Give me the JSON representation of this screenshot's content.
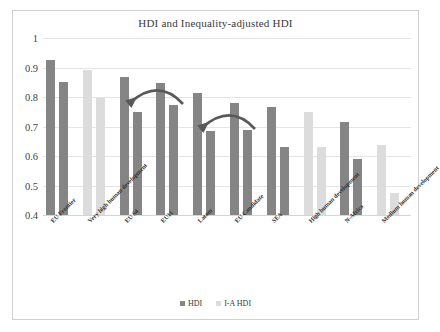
{
  "chart_data": {
    "type": "bar",
    "title": "HDI and Inequality-adjusted HDI",
    "xlabel": "",
    "ylabel": "",
    "ylim": [
      0.4,
      1
    ],
    "yticks": [
      "1",
      "0.9",
      "0.8",
      "0.7",
      "0.6",
      "0.5",
      "0.4"
    ],
    "grid": true,
    "legend_position": "bottom",
    "categories": [
      "EU Frontier",
      "Very high human development",
      "EU S4",
      "EU11",
      "Latam",
      "EU Candidate",
      "SEA",
      "High human development",
      "N-Africa",
      "Medium human development"
    ],
    "series": [
      {
        "name": "HDI",
        "values": [
          0.925,
          0.892,
          0.868,
          0.848,
          0.812,
          0.779,
          0.767,
          0.75,
          0.716,
          0.637
        ]
      },
      {
        "name": "I-A HDI",
        "values": [
          0.851,
          0.798,
          0.748,
          0.772,
          0.686,
          0.689,
          0.63,
          0.63,
          0.591,
          0.475
        ]
      }
    ],
    "category_shading": [
      "dark",
      "light",
      "dark",
      "dark",
      "dark",
      "dark",
      "dark",
      "light",
      "dark",
      "light"
    ],
    "annotations": [
      {
        "name": "arrow-eu11-to-eus4",
        "description": "curved arrow pointing left from EU11 to EU S4"
      },
      {
        "name": "arrow-eucandidate-to-latam",
        "description": "curved arrow pointing left from EU Candidate to Latam"
      }
    ]
  },
  "colors": {
    "bar_dark": "#858585",
    "bar_light": "#dcdcdc",
    "gridline": "#e4e4e4",
    "border": "#d0d0d0",
    "text": "#3a3a3a",
    "arrow": "#595959"
  },
  "legend": {
    "items": [
      {
        "label": "HDI",
        "shade": "dark"
      },
      {
        "label": "I-A HDI",
        "shade": "light"
      }
    ]
  }
}
